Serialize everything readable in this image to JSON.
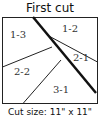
{
  "title": "First cut",
  "caption": "Cut size: 11\" x 11\"",
  "pieces": [
    {
      "id": "1-3",
      "label": "1-3"
    },
    {
      "id": "1-2",
      "label": "1-2"
    },
    {
      "id": "2-1",
      "label": "2-1"
    },
    {
      "id": "2-2",
      "label": "2-2"
    },
    {
      "id": "3-1",
      "label": "3-1"
    }
  ],
  "colors": {
    "line": "#111111",
    "text": "#333333",
    "background": "#ffffff"
  }
}
